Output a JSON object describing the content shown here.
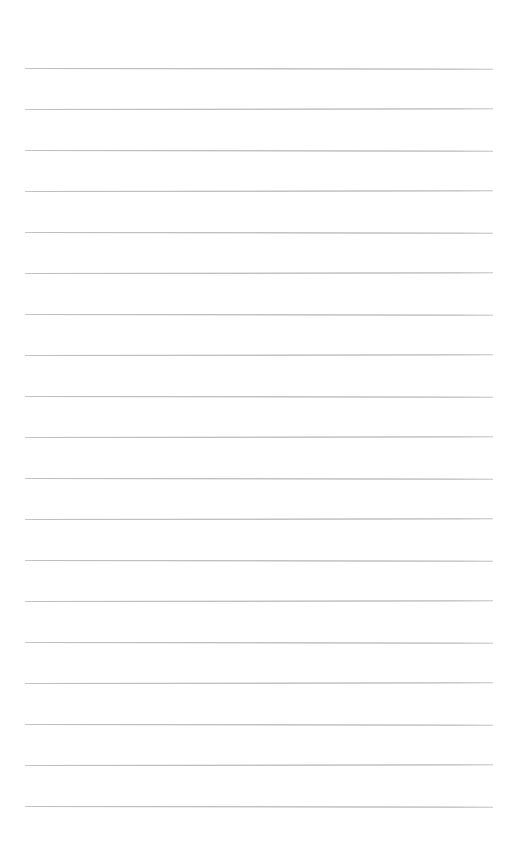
{
  "page": {
    "kind": "ruled-paper-sheet",
    "width": 512,
    "height": 847,
    "background_color": "#ffffff",
    "content_text": "",
    "title": "",
    "header_text": "",
    "footer_text": ""
  },
  "ruling": {
    "line_count": 19,
    "line_color": "#c9c9cd",
    "line_thickness_px": 1,
    "first_line_y": 68,
    "line_spacing_px": 41,
    "left_margin_x": 25,
    "right_edge_x": 493,
    "line_length_px": 468,
    "tilt_deg": 0.08,
    "line_y_positions": [
      68,
      109,
      150,
      191,
      232,
      273,
      314,
      355,
      396,
      437,
      478,
      519,
      560,
      601,
      642,
      683,
      724,
      765,
      806
    ]
  },
  "writing": {
    "placeholder": "",
    "value": ""
  }
}
